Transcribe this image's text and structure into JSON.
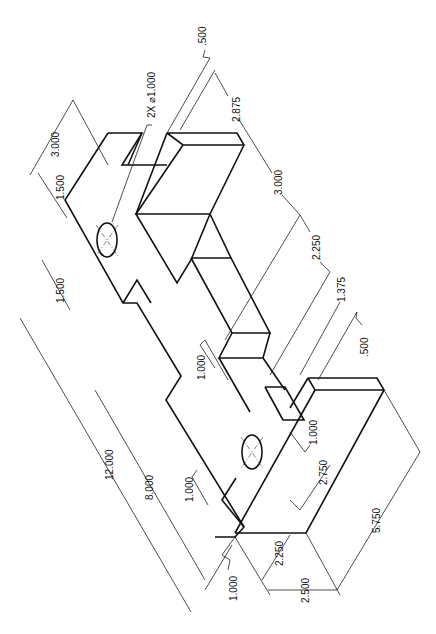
{
  "drawing": {
    "type": "isometric-dimensioned-part",
    "dimensions": {
      "overall_length": "12.000",
      "length_8": "8.000",
      "hole_spacing_1": "1.500",
      "hole_spacing_2": "1.500",
      "top_width": "3.000",
      "hole_callout": "2X ⌀1.000",
      "slot_top": ".500",
      "slot_length": "2.875",
      "block_width": "3.000",
      "block_span": "2.250",
      "step_1375": "1.375",
      "slot_bottom": ".500",
      "step_1000_left": "1.000",
      "hole_offset": "1.000",
      "width_2750": "2.750",
      "bottom_1000": "1.000",
      "depth_2250": "2.250",
      "base_2500": "2.500",
      "overall_5750": "5.750",
      "edge_1000": "1.000"
    }
  }
}
